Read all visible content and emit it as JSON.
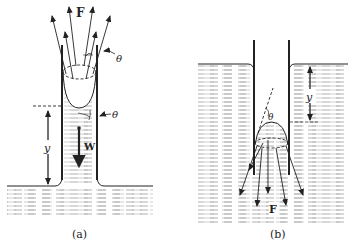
{
  "figure": {
    "panels": [
      {
        "id": "a",
        "caption": "(a)",
        "labels": {
          "force": "F",
          "weight": "W",
          "height": "y",
          "angle_top": "θ",
          "angle_side": "θ"
        },
        "description": "Capillary rise: concave meniscus in tube, surface tension forces F pull upward, weight W downward, column height y above outside surface"
      },
      {
        "id": "b",
        "caption": "(b)",
        "labels": {
          "force": "F",
          "height": "y",
          "angle": "θ"
        },
        "description": "Capillary depression: convex meniscus in tube below outside surface by y, surface tension forces F pointing downward"
      }
    ],
    "colors": {
      "ink": "#222222",
      "hatch": "#9a9a9a",
      "background": "#ffffff"
    }
  }
}
